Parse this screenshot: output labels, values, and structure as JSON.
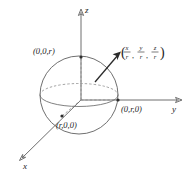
{
  "figure": {
    "type": "3d-sphere-coordinate-diagram",
    "background_color": "#ffffff",
    "line_color": "#6e6e6e",
    "dash_color": "#8a8a8a",
    "text_color": "#242424"
  },
  "axes": {
    "z": {
      "label": "z",
      "arrow": "up"
    },
    "y": {
      "label": "y",
      "arrow": "right"
    },
    "x": {
      "label": "x",
      "arrow": "down-left"
    }
  },
  "points": {
    "top": {
      "label": "(0,0,r)",
      "axis": "z"
    },
    "right": {
      "label": "(0,r,0)",
      "axis": "y"
    },
    "front": {
      "label": "(r,0,0)",
      "axis": "x"
    }
  },
  "annotation": {
    "open_paren": "(",
    "close_paren": ")",
    "comma": ",",
    "terms": [
      {
        "numerator": "x",
        "denominator": "r"
      },
      {
        "numerator": "y",
        "denominator": "r"
      },
      {
        "numerator": "z",
        "denominator": "r"
      }
    ],
    "plain_text": "(x/r, y/r, z/r)"
  }
}
